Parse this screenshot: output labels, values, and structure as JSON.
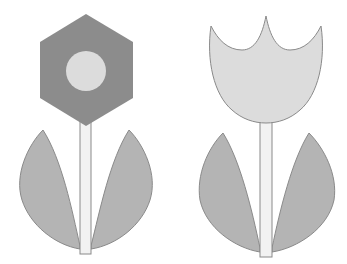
{
  "figure": {
    "background": "#ffffff"
  },
  "colors": {
    "dark_petal": "#8c8c8c",
    "light_fill": "#dcdcdc",
    "leaf": "#b4b4b4",
    "stem": "#f2f2f2",
    "outline": "#8a8a8a"
  },
  "flowers": [
    {
      "name": "hexagon-flower",
      "head_shape": "hexagon",
      "center_shape": "circle"
    },
    {
      "name": "tulip-flower",
      "head_shape": "tulip-cup"
    }
  ]
}
